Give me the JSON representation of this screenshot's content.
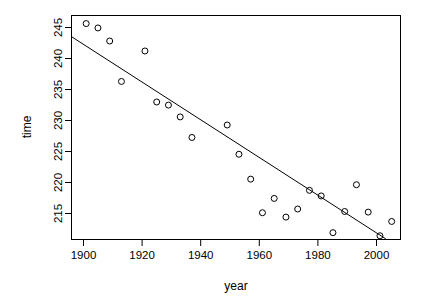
{
  "chart_data": {
    "type": "scatter",
    "title": "",
    "subtitle": "",
    "xlabel": "year",
    "ylabel": "time",
    "xlim": [
      1895,
      2007
    ],
    "ylim": [
      211.5,
      247.5
    ],
    "grid": false,
    "legend": null,
    "x_ticks": [
      1900,
      1920,
      1940,
      1960,
      1980,
      2000
    ],
    "x_tick_labels": [
      "1900",
      "1920",
      "1940",
      "1960",
      "1980",
      "2000"
    ],
    "y_ticks": [
      215,
      220,
      225,
      230,
      235,
      240,
      245
    ],
    "y_tick_labels": [
      "215",
      "220",
      "225",
      "230",
      "235",
      "240",
      "245"
    ],
    "point_marker": "open-circle",
    "point_radius": 3,
    "x": [
      1900,
      1904,
      1908,
      1912,
      1920,
      1924,
      1928,
      1932,
      1936,
      1948,
      1952,
      1956,
      1960,
      1964,
      1968,
      1972,
      1976,
      1980,
      1984,
      1988,
      1992,
      1996,
      2000,
      2004
    ],
    "y": [
      246.2,
      245.5,
      243.4,
      236.9,
      241.8,
      233.6,
      233.1,
      231.2,
      227.9,
      229.9,
      225.2,
      221.2,
      215.8,
      218.1,
      215.1,
      216.4,
      219.4,
      218.5,
      212.6,
      216.0,
      220.3,
      215.9,
      212.1,
      214.4
    ],
    "series": [
      {
        "name": "time",
        "x": [
          1900,
          1904,
          1908,
          1912,
          1920,
          1924,
          1928,
          1932,
          1936,
          1948,
          1952,
          1956,
          1960,
          1964,
          1968,
          1972,
          1976,
          1980,
          1984,
          1988,
          1992,
          1996,
          2000,
          2004
        ],
        "values": [
          246.2,
          245.5,
          243.4,
          236.9,
          241.8,
          233.6,
          233.1,
          231.2,
          227.9,
          229.9,
          225.2,
          221.2,
          215.8,
          218.1,
          215.1,
          216.4,
          219.4,
          218.5,
          212.6,
          216.0,
          220.3,
          215.9,
          212.1,
          214.4
        ]
      }
    ],
    "fit_line": {
      "type": "linear-regression",
      "x_start": 1895,
      "y_start": 244.1,
      "x_end": 2002,
      "y_end": 211.6
    }
  }
}
